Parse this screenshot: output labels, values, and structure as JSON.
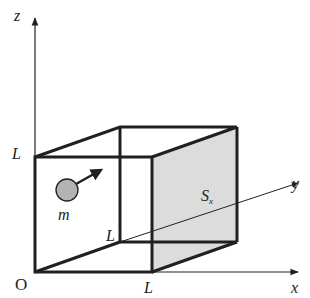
{
  "diagram": {
    "axes": {
      "x_label": "x",
      "y_label": "y",
      "z_label": "z",
      "origin_label": "O"
    },
    "labels": {
      "z_side": "L",
      "x_side": "L",
      "y_side": "L",
      "particle": "m",
      "face_main": "S",
      "face_sub": "x"
    },
    "colors": {
      "line": "#231f20",
      "face_fill": "#d9d9d9",
      "particle_fill": "#b3b3b3"
    }
  }
}
